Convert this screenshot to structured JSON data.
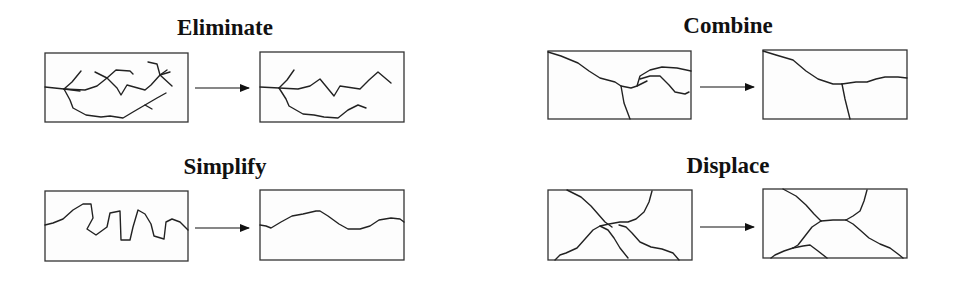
{
  "panels": [
    {
      "id": "eliminate",
      "title": "Eliminate"
    },
    {
      "id": "combine",
      "title": "Combine"
    },
    {
      "id": "simplify",
      "title": "Simplify"
    },
    {
      "id": "displace",
      "title": "Displace"
    }
  ],
  "colors": {
    "line": "#222222",
    "box_border": "#333333",
    "background": "#ffffff"
  }
}
